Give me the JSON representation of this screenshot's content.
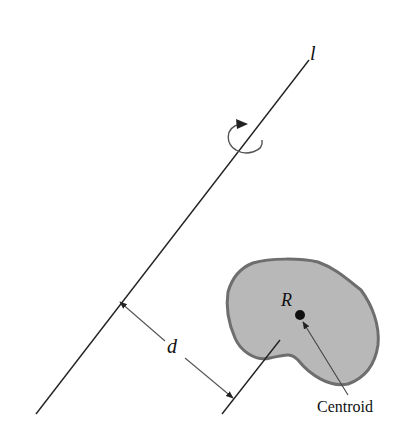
{
  "diagram": {
    "axis_label": "l",
    "region_label": "R",
    "distance_label": "d",
    "centroid_label": "Centroid",
    "colors": {
      "line": "#222222",
      "region_fill": "#b8b8b8",
      "region_border": "#6e6e6e",
      "arrow": "#555555"
    }
  }
}
